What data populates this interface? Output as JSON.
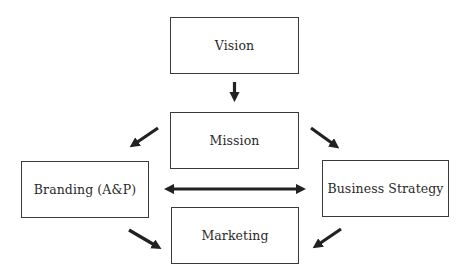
{
  "diagram": {
    "nodes": [
      {
        "id": "vision",
        "label": "Vision"
      },
      {
        "id": "mission",
        "label": "Mission"
      },
      {
        "id": "branding",
        "label": "Branding (A&P)"
      },
      {
        "id": "business_strategy",
        "label": "Business Strategy"
      },
      {
        "id": "marketing",
        "label": "Marketing"
      }
    ],
    "edges": [
      {
        "from": "vision",
        "to": "mission",
        "type": "arrow"
      },
      {
        "from": "mission",
        "to": "branding",
        "type": "arrow"
      },
      {
        "from": "mission",
        "to": "business_strategy",
        "type": "arrow"
      },
      {
        "from": "branding",
        "to": "business_strategy",
        "type": "double-arrow"
      },
      {
        "from": "branding",
        "to": "marketing",
        "type": "arrow"
      },
      {
        "from": "business_strategy",
        "to": "marketing",
        "type": "arrow"
      }
    ],
    "colors": {
      "stroke": "#3a3a3a",
      "arrow": "#222222",
      "text": "#2a2a2a",
      "background": "#ffffff"
    }
  }
}
